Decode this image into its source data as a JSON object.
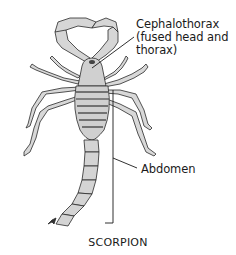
{
  "diagram": {
    "title": "SCORPION",
    "subject": "scorpion",
    "labels": {
      "cephalothorax_line1": "Cephalothorax",
      "cephalothorax_line2": "(fused head and",
      "cephalothorax_line3": "thorax)",
      "abdomen": "Abdomen"
    },
    "colors": {
      "background": "#ffffff",
      "body_fill": "#d4d4d4",
      "outline": "#2a2a2a",
      "text": "#1a1a1a"
    }
  }
}
